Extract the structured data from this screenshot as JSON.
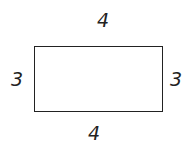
{
  "figure": {
    "shape": "rectangle",
    "labels": {
      "top": "4",
      "bottom": "4",
      "left": "3",
      "right": "3"
    }
  }
}
